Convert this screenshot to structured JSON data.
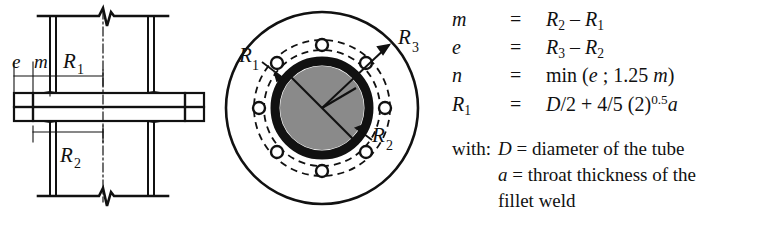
{
  "figure": {
    "colors": {
      "background": "#ffffff",
      "line": "#111111",
      "bore_fill": "#8a8a8a",
      "tube_wall": "#111111"
    },
    "side_view": {
      "name": "tube flange side cross-section",
      "labels": {
        "e": "e",
        "m": "m",
        "R1": "R",
        "R1_sub": "1",
        "R2": "R",
        "R2_sub": "2"
      }
    },
    "plan_view": {
      "name": "flange plan view with bolt circle",
      "bolt_count": 8,
      "labels": {
        "R1": "R",
        "R1_sub": "1",
        "R2": "R",
        "R2_sub": "2",
        "R3": "R",
        "R3_sub": "3"
      }
    }
  },
  "equations": [
    {
      "symbol": "m",
      "symbol_sub": "",
      "equals": "=",
      "expression_parts": [
        {
          "t": "R",
          "style": "italic"
        },
        {
          "t": "2",
          "style": "sub"
        },
        {
          "t": " – ",
          "style": "plain"
        },
        {
          "t": "R",
          "style": "italic"
        },
        {
          "t": "1",
          "style": "sub"
        }
      ],
      "expression_text": "R2 – R1"
    },
    {
      "symbol": "e",
      "symbol_sub": "",
      "equals": "=",
      "expression_parts": [
        {
          "t": "R",
          "style": "italic"
        },
        {
          "t": "3",
          "style": "sub"
        },
        {
          "t": " – ",
          "style": "plain"
        },
        {
          "t": "R",
          "style": "italic"
        },
        {
          "t": "2",
          "style": "sub"
        }
      ],
      "expression_text": "R3 – R2"
    },
    {
      "symbol": "n",
      "symbol_sub": "",
      "equals": "=",
      "expression_parts": [
        {
          "t": "min (",
          "style": "plain"
        },
        {
          "t": "e",
          "style": "italic"
        },
        {
          "t": " ; 1.25 ",
          "style": "plain"
        },
        {
          "t": "m",
          "style": "italic"
        },
        {
          "t": ")",
          "style": "plain"
        }
      ],
      "expression_text": "min (e ; 1.25 m)"
    },
    {
      "symbol": "R",
      "symbol_sub": "1",
      "equals": "=",
      "expression_parts": [
        {
          "t": "D",
          "style": "italic"
        },
        {
          "t": "/2 + 4/5 (2)",
          "style": "plain"
        },
        {
          "t": "0.5",
          "style": "sup"
        },
        {
          "t": "a",
          "style": "italic"
        }
      ],
      "expression_text": "D/2 + 4/5 (2)^0.5 a"
    }
  ],
  "legend": {
    "lead": "with:",
    "lines": [
      {
        "symbol": "D",
        "equals": "=",
        "text": "diameter of the tube"
      },
      {
        "symbol": "a",
        "equals": "=",
        "text": "throat thickness of the"
      },
      {
        "symbol": "",
        "equals": "",
        "text": "fillet weld"
      }
    ]
  }
}
